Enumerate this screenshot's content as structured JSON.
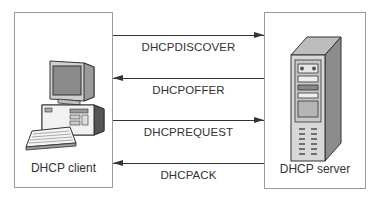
{
  "client": {
    "label": "DHCP client",
    "icon": "desktop-computer-icon"
  },
  "server": {
    "label": "DHCP server",
    "icon": "tower-server-icon"
  },
  "messages": [
    {
      "label": "DHCPDISCOVER",
      "direction": "client-to-server"
    },
    {
      "label": "DHCPOFFER",
      "direction": "server-to-client"
    },
    {
      "label": "DHCPREQUEST",
      "direction": "client-to-server"
    },
    {
      "label": "DHCPACK",
      "direction": "server-to-client"
    }
  ]
}
